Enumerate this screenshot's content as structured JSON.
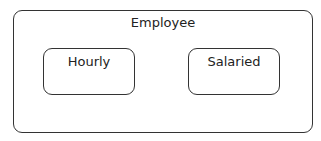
{
  "diagram": {
    "container": {
      "label": "Employee"
    },
    "children": [
      {
        "label": "Hourly"
      },
      {
        "label": "Salaried"
      }
    ]
  }
}
